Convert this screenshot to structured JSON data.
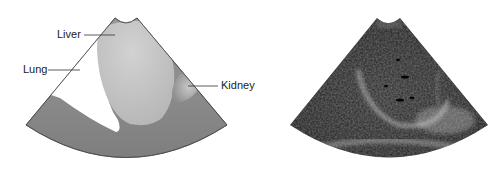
{
  "figure": {
    "left_panel": {
      "type": "illustration",
      "labels": [
        {
          "id": "liver",
          "text": "Liver"
        },
        {
          "id": "lung",
          "text": "Lung"
        },
        {
          "id": "kidney",
          "text": "Kidney"
        }
      ]
    },
    "right_panel": {
      "type": "ultrasound-image"
    }
  },
  "colors": {
    "fan_outer": "#8e8e8e",
    "liver": "#c4c4c4",
    "lung": "#ffffff",
    "kidney": "#a9a9a9",
    "ultrasound_bg": "#1e1e1e"
  }
}
